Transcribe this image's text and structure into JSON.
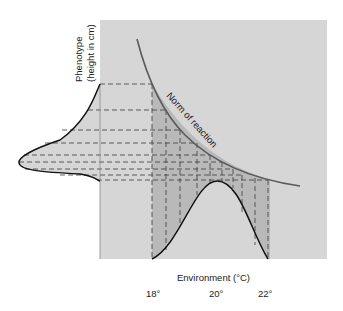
{
  "diagram": {
    "type": "norm-of-reaction",
    "y_axis_label_line1": "Phenotype",
    "y_axis_label_line2": "(height in cm)",
    "x_axis_label": "Environment (°C)",
    "x_ticks": [
      "18°",
      "20°",
      "22°"
    ],
    "curve_label": "Norm of reaction",
    "colors": {
      "panel": "#d6d6d6",
      "shaded": "#b9b9b9",
      "curve": "#5a5a5a",
      "distribution": "#111111",
      "dash": "#3a3a3a"
    }
  }
}
